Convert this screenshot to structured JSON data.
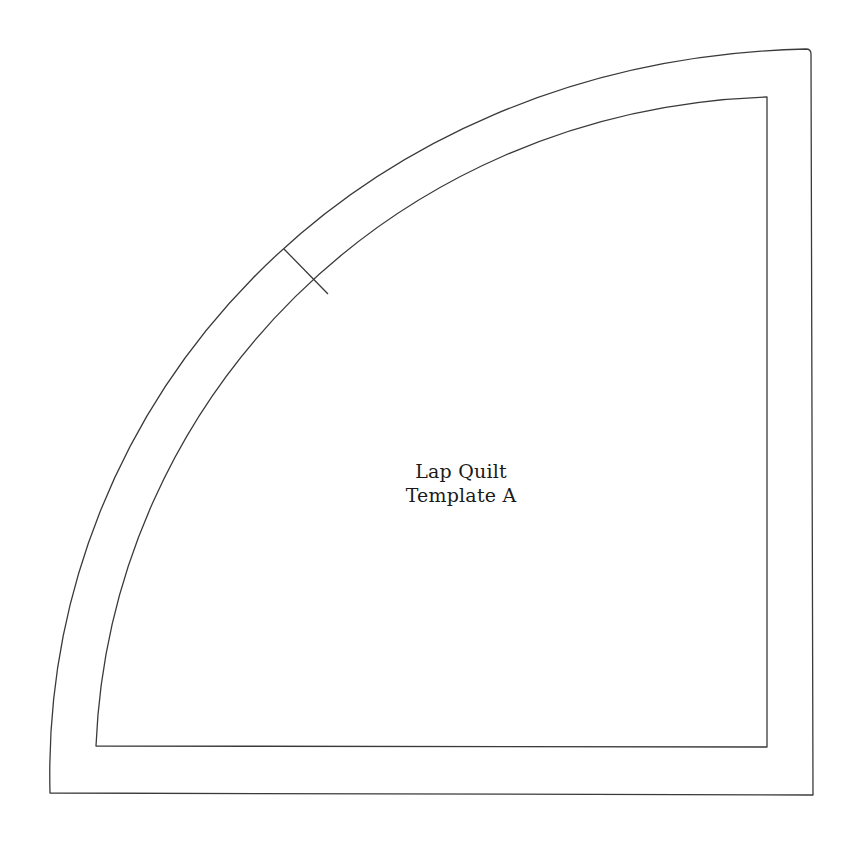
{
  "template": {
    "label_line1": "Lap Quilt",
    "label_line2": "Template A",
    "stroke_color": "#3a3a3a",
    "background_color": "#ffffff"
  },
  "shapes": {
    "outer_cut_line": "quarter-circle outline with seam allowance",
    "inner_sewing_line": "quarter-circle sewing line",
    "alignment_mark": "registration tick on curved edge"
  }
}
